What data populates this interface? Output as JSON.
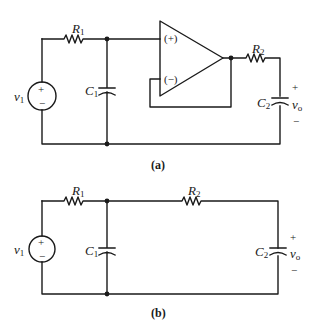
{
  "figures": [
    {
      "id": "a",
      "caption": "(a)",
      "components": {
        "source": {
          "name": "v",
          "sub": "1",
          "plus": "+",
          "minus": "−"
        },
        "r1": {
          "name": "R",
          "sub": "1"
        },
        "c1": {
          "name": "C",
          "sub": "1"
        },
        "opamp": {
          "noninv": "(+)",
          "inv": "(−)"
        },
        "r2": {
          "name": "R",
          "sub": "2"
        },
        "c2": {
          "name": "C",
          "sub": "2"
        },
        "output": {
          "name": "v",
          "sub": "o",
          "plus": "+",
          "minus": "−"
        }
      }
    },
    {
      "id": "b",
      "caption": "(b)",
      "components": {
        "source": {
          "name": "v",
          "sub": "1",
          "plus": "+",
          "minus": "−"
        },
        "r1": {
          "name": "R",
          "sub": "1"
        },
        "c1": {
          "name": "C",
          "sub": "1"
        },
        "r2": {
          "name": "R",
          "sub": "2"
        },
        "c2": {
          "name": "C",
          "sub": "2"
        },
        "output": {
          "name": "v",
          "sub": "o",
          "plus": "+",
          "minus": "−"
        }
      }
    }
  ]
}
